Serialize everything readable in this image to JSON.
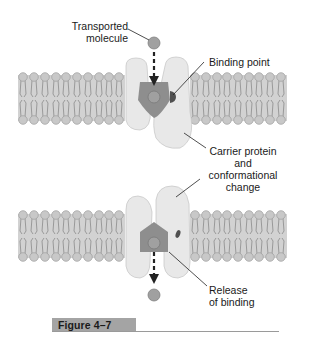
{
  "diagram": {
    "figure_label": "Figure 4–7",
    "labels": {
      "transported_molecule": [
        "Transported",
        "molecule"
      ],
      "binding_point": "Binding point",
      "carrier_protein": [
        "Carrier protein",
        "and",
        "conformational",
        "change"
      ],
      "release": [
        "Release",
        "of binding"
      ]
    },
    "stages": [
      {
        "name": "binding",
        "description": "Molecule enters carrier and binds at binding point"
      },
      {
        "name": "release",
        "description": "Carrier changes conformation and releases molecule"
      }
    ],
    "colors": {
      "membrane_band": "#cfcfcf",
      "lipid_head": "#c4c4c4",
      "protein": "#e6e6e6",
      "binding_pocket": "#8f8f8f",
      "molecule": "#9a9a9a",
      "binding_site": "#555555",
      "arrow": "#222222",
      "leader_line": "#222222",
      "figure_badge": "#a4a4a4"
    }
  }
}
